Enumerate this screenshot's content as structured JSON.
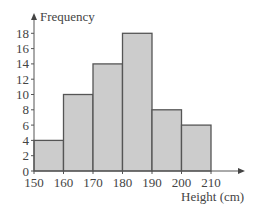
{
  "chart_data": {
    "type": "bar",
    "subtype": "histogram",
    "title": "",
    "xlabel": "Height (cm)",
    "ylabel": "Frequency",
    "bins": [
      [
        150,
        160
      ],
      [
        160,
        170
      ],
      [
        170,
        180
      ],
      [
        180,
        190
      ],
      [
        190,
        200
      ],
      [
        200,
        210
      ]
    ],
    "categories": [
      "150-160",
      "160-170",
      "170-180",
      "180-190",
      "190-200",
      "200-210"
    ],
    "values": [
      4,
      10,
      14,
      18,
      8,
      6
    ],
    "x_ticks": [
      150,
      160,
      170,
      180,
      190,
      200,
      210
    ],
    "y_ticks": [
      0,
      2,
      4,
      6,
      8,
      10,
      12,
      14,
      16,
      18
    ],
    "xlim": [
      150,
      215
    ],
    "ylim": [
      0,
      19
    ],
    "grid": false,
    "legend": null,
    "bar_fill": "#cccccc",
    "bar_edge": "#555555"
  },
  "labels": {
    "y_axis": "Frequency",
    "x_axis": "Height (cm)"
  }
}
